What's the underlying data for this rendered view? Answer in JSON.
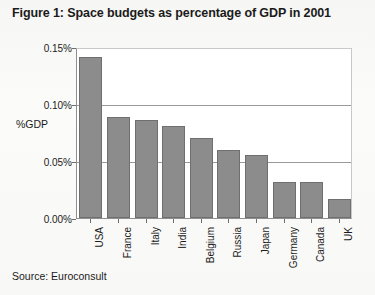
{
  "figure": {
    "title": "Figure 1: Space budgets as percentage of GDP in 2001",
    "source": "Source: Euroconsult"
  },
  "chart_data": {
    "type": "bar",
    "title": "Figure 1: Space budgets as percentage of GDP in 2001",
    "xlabel": "",
    "ylabel": "%GDP",
    "categories": [
      "USA",
      "France",
      "Italy",
      "India",
      "Belgium",
      "Russia",
      "Japan",
      "Germany",
      "Canada",
      "UK"
    ],
    "values": [
      0.141,
      0.089,
      0.086,
      0.081,
      0.07,
      0.06,
      0.055,
      0.032,
      0.032,
      0.017
    ],
    "ylim": [
      0,
      0.15
    ],
    "ytick_values": [
      0,
      0.05,
      0.1,
      0.15
    ],
    "ytick_labels": [
      "0.00%",
      "0.05%",
      "0.10%",
      "0.15%"
    ],
    "grid": true,
    "legend": false,
    "bar_color": "#8c8c8c",
    "plot_background": "#ffffff"
  }
}
